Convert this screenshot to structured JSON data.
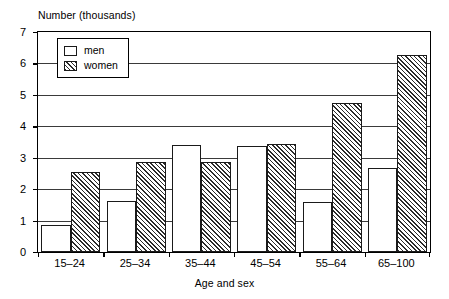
{
  "chart_data": {
    "type": "bar",
    "title": "",
    "ylabel": "Number (thousands)",
    "xlabel": "Age and sex",
    "categories": [
      "15–24",
      "25–34",
      "35–44",
      "45–54",
      "55–64",
      "65–100"
    ],
    "series": [
      {
        "name": "men",
        "values": [
          0.85,
          1.63,
          3.42,
          3.36,
          1.58,
          2.68
        ]
      },
      {
        "name": "women",
        "values": [
          2.55,
          2.85,
          2.88,
          3.43,
          4.73,
          6.28
        ]
      }
    ],
    "ylim": [
      0,
      7
    ],
    "ytick_labels": [
      "0",
      "1",
      "2",
      "3",
      "4",
      "5",
      "6",
      "7"
    ],
    "ytick_values": [
      0,
      1,
      2,
      3,
      4,
      5,
      6,
      7
    ],
    "grid": "horizontal",
    "legend_position": "top-left-inside",
    "colors": {
      "men_fill": "#ffffff",
      "women_fill": "#ffffff",
      "women_hatch": "#2b2b2b",
      "bar_edge": "#1a1a1a",
      "axis": "#000000",
      "gridline": "#3a3a3a",
      "background": "#ffffff"
    }
  },
  "legend": {
    "items": [
      {
        "label": "men",
        "pattern": "solid-white"
      },
      {
        "label": "women",
        "pattern": "diagonal-hatch"
      }
    ]
  }
}
